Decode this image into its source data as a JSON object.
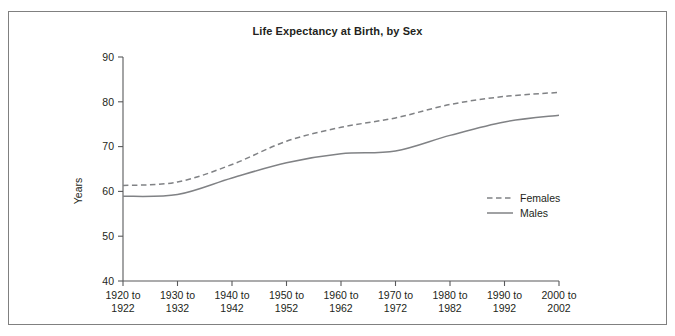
{
  "figure": {
    "title": "Life Expectancy at Birth, by Sex",
    "border_color": "#808080",
    "line_color": "#808285",
    "axis_color": "#58595b"
  },
  "chart_data": {
    "type": "line",
    "title": "Life Expectancy at Birth, by Sex",
    "xlabel": "",
    "ylabel": "Years",
    "ylim": [
      40,
      90
    ],
    "yticks": [
      40,
      50,
      60,
      70,
      80,
      90
    ],
    "ytick_labels": [
      "40",
      "50",
      "60",
      "70",
      "80",
      "90"
    ],
    "grid": false,
    "legend_position": "center-right",
    "categories": [
      "1920 to\n1922",
      "1930 to\n1932",
      "1940 to\n1942",
      "1950 to\n1952",
      "1960 to\n1962",
      "1970 to\n1972",
      "1980 to\n1982",
      "1990 to\n1992",
      "2000 to\n2002"
    ],
    "category_lines": [
      [
        "1920 to",
        "1922"
      ],
      [
        "1930 to",
        "1932"
      ],
      [
        "1940 to",
        "1942"
      ],
      [
        "1950 to",
        "1952"
      ],
      [
        "1960 to",
        "1962"
      ],
      [
        "1970 to",
        "1972"
      ],
      [
        "1980 to",
        "1982"
      ],
      [
        "1990 to",
        "1992"
      ],
      [
        "2000 to",
        "2002"
      ]
    ],
    "series": [
      {
        "name": "Females",
        "style": "dashed",
        "values": [
          61.3,
          62.1,
          66.0,
          71.2,
          74.3,
          76.4,
          79.4,
          81.2,
          82.1
        ]
      },
      {
        "name": "Males",
        "style": "solid",
        "values": [
          58.9,
          59.3,
          63.0,
          66.4,
          68.4,
          69.0,
          72.5,
          75.5,
          77.0
        ]
      }
    ]
  },
  "legend": {
    "items": [
      {
        "label": "Females",
        "style": "dashed"
      },
      {
        "label": "Males",
        "style": "solid"
      }
    ]
  }
}
